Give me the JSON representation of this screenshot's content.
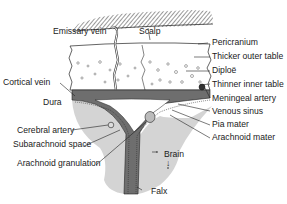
{
  "diagram": {
    "labels": {
      "emissary_vein": "Emissary vein",
      "scalp": "Scalp",
      "pericranium": "Pericranium",
      "thicker_outer_table": "Thicker outer table",
      "diploe": "Diploë",
      "thinner_inner_table": "Thinner inner table",
      "meningeal_artery": "Meningeal artery",
      "venous_sinus": "Venous sinus",
      "pia_mater": "Pia mater",
      "arachnoid_mater": "Arachnoid mater",
      "cortical_vein": "Cortical vein",
      "dura": "Dura",
      "cerebral_artery": "Cerebral artery",
      "subarachnoid_space": "Subarachnoid space",
      "arachnoid_granulation": "Arachnoid granulation",
      "brain": "Brain",
      "falx": "Falx"
    },
    "colors": {
      "background": "#ffffff",
      "bone": "#ffffff",
      "dura": "#6e6e6e",
      "brain": "#d4d4d4",
      "outline": "#222222",
      "hatch": "#333333"
    }
  }
}
